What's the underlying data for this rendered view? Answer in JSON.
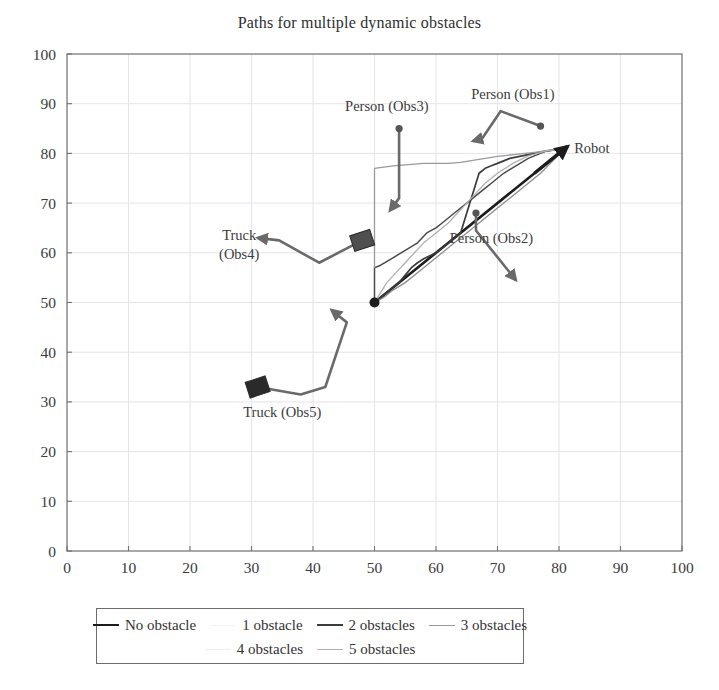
{
  "chart_data": {
    "type": "line",
    "title": "Paths for multiple dynamic obstacles",
    "xlabel": "",
    "ylabel": "",
    "xlim": [
      0,
      100
    ],
    "ylim": [
      0,
      100
    ],
    "grid": true,
    "xticks": [
      0,
      10,
      20,
      30,
      40,
      50,
      60,
      70,
      80,
      90,
      100
    ],
    "yticks": [
      0,
      10,
      20,
      30,
      40,
      50,
      60,
      70,
      80,
      90,
      100
    ],
    "legend_position": "below-axes",
    "start_point": {
      "x": 50,
      "y": 50,
      "label": "start"
    },
    "goal_point": {
      "x": 81,
      "y": 81,
      "label": "Robot"
    },
    "series": [
      {
        "name": "No obstacle",
        "color": "#1c1c1c",
        "width": 2.6,
        "points": [
          [
            50,
            50
          ],
          [
            81,
            81
          ]
        ]
      },
      {
        "name": "1 obstacle",
        "color": "#4a4a4a",
        "width": 1.5,
        "points": [
          [
            50,
            50
          ],
          [
            50,
            57
          ],
          [
            51,
            57.5
          ],
          [
            53,
            59
          ],
          [
            55,
            60.5
          ],
          [
            57,
            62
          ],
          [
            58.5,
            64
          ],
          [
            60,
            65
          ],
          [
            61,
            66
          ],
          [
            62,
            67
          ],
          [
            63,
            68
          ],
          [
            64,
            69
          ],
          [
            65,
            70
          ],
          [
            66,
            71
          ],
          [
            67,
            72
          ],
          [
            68,
            73
          ],
          [
            69,
            74
          ],
          [
            70,
            75
          ],
          [
            71,
            76
          ],
          [
            73,
            77.5
          ],
          [
            75,
            79
          ],
          [
            78,
            80.5
          ],
          [
            81,
            81
          ]
        ]
      },
      {
        "name": "2 obstacles",
        "color": "#3c3c3c",
        "width": 1.7,
        "points": [
          [
            50,
            50
          ],
          [
            51,
            51
          ],
          [
            52.5,
            52.5
          ],
          [
            54,
            54
          ],
          [
            55,
            55.5
          ],
          [
            56,
            57
          ],
          [
            57,
            58
          ],
          [
            58,
            58.8
          ],
          [
            59,
            59.4
          ],
          [
            60,
            60
          ],
          [
            61,
            61
          ],
          [
            62,
            62
          ],
          [
            63,
            63
          ],
          [
            64,
            64
          ],
          [
            64.5,
            66
          ],
          [
            65,
            68
          ],
          [
            65.5,
            70
          ],
          [
            66,
            72
          ],
          [
            66.5,
            74
          ],
          [
            67,
            76
          ],
          [
            68,
            77
          ],
          [
            69,
            77.5
          ],
          [
            70,
            78
          ],
          [
            71,
            78.5
          ],
          [
            72,
            79
          ],
          [
            74,
            79.5
          ],
          [
            76,
            80
          ],
          [
            78,
            80.5
          ],
          [
            81,
            81
          ]
        ]
      },
      {
        "name": "3 obstacles",
        "color": "#9a9a9a",
        "width": 1.3,
        "points": [
          [
            50,
            57
          ],
          [
            50,
            77
          ],
          [
            53,
            77.5
          ],
          [
            58,
            78
          ],
          [
            62,
            78
          ],
          [
            64,
            78.2
          ],
          [
            66,
            78.6
          ],
          [
            68,
            79
          ],
          [
            70,
            79.4
          ],
          [
            73,
            79.8
          ],
          [
            76,
            80.2
          ],
          [
            81,
            81
          ]
        ]
      },
      {
        "name": "4 obstacles",
        "color": "#8c8c8c",
        "width": 1.3,
        "points": [
          [
            50,
            50
          ],
          [
            51.5,
            51
          ],
          [
            53,
            52.5
          ],
          [
            55,
            54
          ],
          [
            57,
            56
          ],
          [
            59,
            58
          ],
          [
            61,
            60
          ],
          [
            63,
            62
          ],
          [
            65,
            64
          ],
          [
            67,
            66
          ],
          [
            69,
            68
          ],
          [
            71,
            70
          ],
          [
            73,
            72
          ],
          [
            75,
            74
          ],
          [
            77,
            76
          ],
          [
            79,
            78.5
          ],
          [
            81,
            81
          ]
        ]
      },
      {
        "name": "5 obstacles",
        "color": "#b0b0b0",
        "width": 1.3,
        "points": [
          [
            50,
            50
          ],
          [
            51,
            52
          ],
          [
            52,
            54
          ],
          [
            53.5,
            56
          ],
          [
            55,
            58
          ],
          [
            56.5,
            60
          ],
          [
            58,
            62
          ],
          [
            60,
            64
          ],
          [
            62,
            66
          ],
          [
            63.5,
            68
          ],
          [
            65,
            70
          ],
          [
            66.5,
            72
          ],
          [
            68,
            74
          ],
          [
            70,
            76
          ],
          [
            72.5,
            78
          ],
          [
            75,
            79.5
          ],
          [
            78,
            80.5
          ],
          [
            81,
            81
          ]
        ]
      }
    ],
    "obstacles": [
      {
        "id": "Obs1",
        "label": "Person (Obs1)",
        "label_pos": [
          72.5,
          91
        ],
        "marker": "dot",
        "marker_pos": [
          77,
          85.5
        ],
        "path": [
          [
            77,
            85.5
          ],
          [
            70.5,
            88.5
          ],
          [
            67.5,
            83
          ],
          [
            66,
            82.5
          ]
        ]
      },
      {
        "id": "Obs2",
        "label": "Person (Obs2)",
        "label_pos": [
          69,
          62
        ],
        "marker": "dot",
        "marker_pos": [
          66.5,
          68
        ],
        "path": [
          [
            66.5,
            68
          ],
          [
            66.5,
            64.5
          ],
          [
            73,
            54.5
          ]
        ]
      },
      {
        "id": "Obs3",
        "label": "Person (Obs3)",
        "label_pos": [
          52,
          88.5
        ],
        "marker": "dot",
        "marker_pos": [
          54,
          85
        ],
        "path": [
          [
            54,
            85
          ],
          [
            54,
            71
          ],
          [
            52.5,
            68.5
          ]
        ]
      },
      {
        "id": "Obs4",
        "label": "Truck (Obs4)",
        "label_pos": [
          28,
          62.5
        ],
        "marker": "square",
        "marker_pos": [
          48,
          62.5
        ],
        "path": [
          [
            48,
            62.5
          ],
          [
            41,
            58
          ],
          [
            34.5,
            62.5
          ],
          [
            31,
            63
          ]
        ]
      },
      {
        "id": "Obs5",
        "label": "Truck (Obs5)",
        "label_pos": [
          35,
          27
        ],
        "marker": "square",
        "marker_pos": [
          31,
          33
        ],
        "path": [
          [
            31,
            33
          ],
          [
            38,
            31.5
          ],
          [
            42,
            33
          ],
          [
            45.5,
            46
          ],
          [
            43,
            48.5
          ]
        ]
      }
    ]
  },
  "legend": {
    "rows": [
      [
        {
          "label": "No obstacle",
          "color": "#1c1c1c",
          "width": 2.6
        },
        {
          "label": "1 obstacle",
          "color": "#f3f3f3",
          "width": 1.4
        },
        {
          "label": "2 obstacles",
          "color": "#3c3c3c",
          "width": 2.2
        },
        {
          "label": "3 obstacles",
          "color": "#9a9a9a",
          "width": 1.4
        }
      ],
      [
        {
          "label": "4 obstacles",
          "color": "#efefef",
          "width": 1.4
        },
        {
          "label": "5 obstacles",
          "color": "#b0b0b0",
          "width": 1.4
        }
      ]
    ]
  },
  "labels": {
    "robot": "Robot"
  }
}
